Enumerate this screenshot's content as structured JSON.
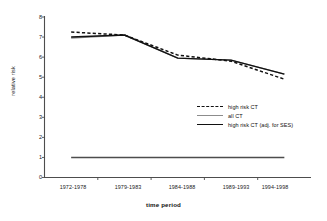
{
  "chart_data": {
    "type": "line",
    "title": "",
    "xlabel": "time period",
    "ylabel": "relative risk",
    "categories": [
      "1972-1978",
      "1979-1983",
      "1984-1988",
      "1989-1993",
      "1994-1998"
    ],
    "ylim": [
      0,
      8
    ],
    "yticks": [
      0,
      1,
      2,
      3,
      4,
      5,
      6,
      7,
      8
    ],
    "ytick_labels": [
      "0",
      "1",
      "2",
      "3",
      "4",
      "5",
      "6",
      "7",
      "8"
    ],
    "grid": false,
    "legend_position": "center-right",
    "series": [
      {
        "name": "high risk CT",
        "style": "dashed",
        "color": "#111111",
        "values": [
          7.25,
          7.1,
          6.1,
          5.8,
          4.9
        ]
      },
      {
        "name": "all CT",
        "style": "solid",
        "color": "#8c8c8c",
        "values": [
          6.95,
          7.1,
          5.95,
          5.85,
          5.15
        ]
      },
      {
        "name": "high risk CT (adj. for SES)",
        "style": "solid",
        "color": "#111111",
        "values": [
          7.0,
          7.1,
          5.95,
          5.85,
          5.15
        ]
      }
    ],
    "reference_line": {
      "name": "reference",
      "value": 1.0,
      "color": "#4d4d4d"
    }
  },
  "axis": {
    "y_label": "relative risk",
    "x_label": "time period",
    "y_tick_0": "0",
    "y_tick_1": "1",
    "y_tick_2": "2",
    "y_tick_3": "3",
    "y_tick_4": "4",
    "y_tick_5": "5",
    "y_tick_6": "6",
    "y_tick_7": "7",
    "y_tick_8": "8",
    "x_tick_0": "1972-1978",
    "x_tick_1": "1979-1983",
    "x_tick_2": "1984-1988",
    "x_tick_3": "1989-1993",
    "x_tick_4": "1994-1998"
  },
  "legend": {
    "items": [
      {
        "label": "high risk CT"
      },
      {
        "label": "all CT"
      },
      {
        "label": "high risk CT (adj. for SES)"
      }
    ]
  },
  "colors": {
    "axis": "#4d4d4d",
    "series_black": "#111111",
    "series_gray": "#8c8c8c",
    "reference": "#4d4d4d",
    "background": "#ffffff"
  }
}
